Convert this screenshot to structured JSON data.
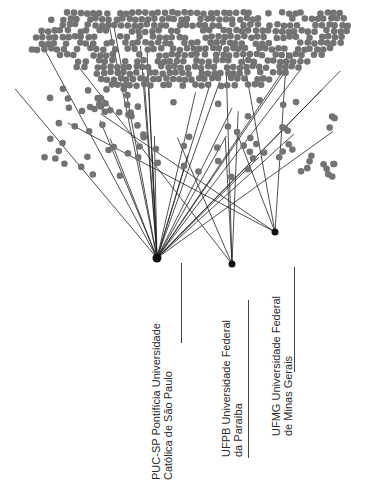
{
  "diagram": {
    "type": "bipartite-network",
    "node_color": "#737373",
    "hub_color": "#111111",
    "edge_color": "#222222",
    "hubs": [
      {
        "id": "pucsp",
        "x": 157,
        "y": 258,
        "r": 4.5
      },
      {
        "id": "ufpb",
        "x": 232,
        "y": 264,
        "r": 3.5
      },
      {
        "id": "ufmg",
        "x": 275,
        "y": 232,
        "r": 3.5
      }
    ],
    "institutions": [
      {
        "id": "pucsp",
        "line1": "PUC-SP Pontifícia Universidade",
        "line2": "Católica de São Paulo"
      },
      {
        "id": "ufpb",
        "line1": "UFPB Universidade Federal",
        "line2": "da Paraíba"
      },
      {
        "id": "ufmg",
        "line1": "UFMG Universidade Federal",
        "line2": "de Minas Gerais"
      }
    ]
  }
}
